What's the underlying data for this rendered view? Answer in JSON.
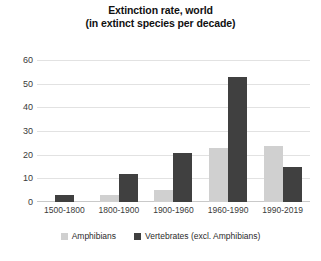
{
  "chart_data": {
    "type": "bar",
    "title": "Extinction rate, world",
    "subtitle": "(in extinct species per decade)",
    "title_lines": [
      "Extinction rate, world",
      "(in extinct species per decade)"
    ],
    "xlabel": "",
    "ylabel": "",
    "ylim": [
      0,
      60
    ],
    "yticks": [
      0,
      10,
      20,
      30,
      40,
      50,
      60
    ],
    "ytick_labels": [
      "0",
      "10",
      "20",
      "30",
      "40",
      "50",
      "60"
    ],
    "grid": true,
    "legend_position": "bottom",
    "categories": [
      "1500-1800",
      "1800-1900",
      "1900-1960",
      "1960-1990",
      "1990-2019"
    ],
    "series": [
      {
        "name": "Amphibians",
        "color": "#D0D0D0",
        "values": [
          0,
          3,
          5,
          23,
          24
        ]
      },
      {
        "name": "Vertebrates (excl. Amphibians)",
        "color": "#404040",
        "values": [
          3,
          12,
          21,
          53,
          15
        ]
      }
    ]
  },
  "colors": {
    "amphibians": "#D0D0D0",
    "vertebrates": "#404040",
    "gridline": "#E2E2E2",
    "axis": "#C9C9C9",
    "background": "#FFFFFF",
    "text": "#2B2B2B"
  }
}
